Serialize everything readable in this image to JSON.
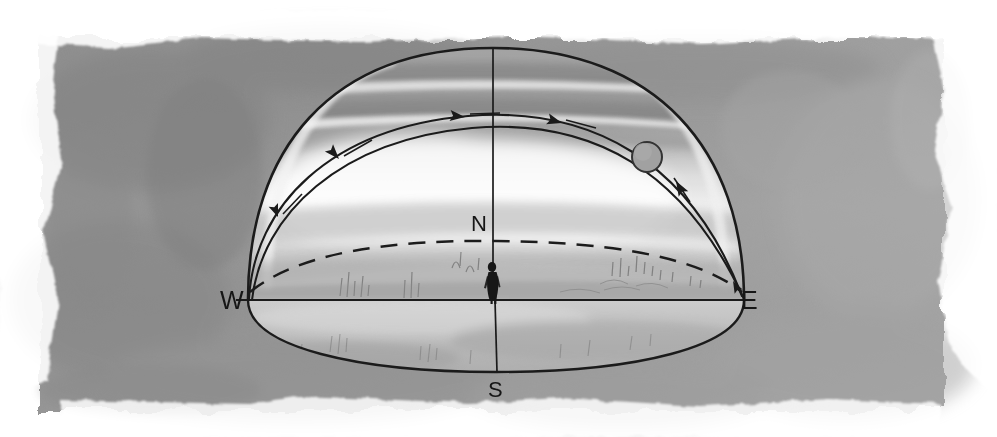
{
  "figure": {
    "kind": "hand-drawn watercolor astronomy diagram",
    "background_wash_color": "#939393",
    "dome_fill_light": "#f2f2f2",
    "ink_color": "#111111",
    "sun_fill_color": "#9a9a9a",
    "paper_color": "#ffffff"
  },
  "labels": {
    "west": "W",
    "east": "E",
    "north": "N",
    "south": "S"
  },
  "elements": {
    "dome_outline_name": "celestial dome outline",
    "horizon_ellipse_name": "horizon circle",
    "sun_path_name": "sun daily path arc",
    "dashed_arc_name": "celestial equator dashed arc",
    "sun_name": "sun disc",
    "observer_name": "observer figure",
    "meridian_name": "meridian line N-S",
    "baseline_name": "horizon line W-E"
  },
  "arrows": {
    "direction_of_motion": "east to west",
    "count": 4,
    "positions": [
      {
        "x": 465,
        "y": 117,
        "angle": 186
      },
      {
        "x": 562,
        "y": 123,
        "angle": 196
      },
      {
        "x": 339,
        "y": 159,
        "angle": 228
      },
      {
        "x": 278,
        "y": 217,
        "angle": 249
      },
      {
        "x": 676,
        "y": 181,
        "angle": 56
      }
    ]
  },
  "geometry": {
    "wash_rect": {
      "x": 38,
      "y": 36,
      "w": 908,
      "h": 376
    },
    "dome_apex": {
      "x": 493,
      "y": 48
    },
    "horizon_west": {
      "x": 248,
      "y": 300
    },
    "horizon_east": {
      "x": 744,
      "y": 300
    },
    "horizon_bottom_y": 372,
    "sun_disc": {
      "cx": 647,
      "cy": 157,
      "r": 15
    },
    "observer": {
      "x": 493,
      "y": 300,
      "h": 38
    }
  },
  "label_positions": {
    "west": {
      "x": 222,
      "y": 291
    },
    "east": {
      "x": 742,
      "y": 291
    },
    "north": {
      "x": 472,
      "y": 214
    },
    "south": {
      "x": 487,
      "y": 380
    }
  }
}
